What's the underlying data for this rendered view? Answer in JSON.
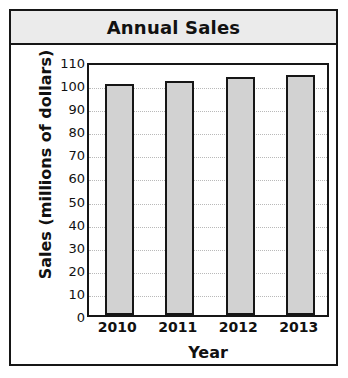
{
  "chart_data": {
    "type": "bar",
    "title": "Annual Sales",
    "xlabel": "Year",
    "ylabel": "Sales (millions of dollars)",
    "categories": [
      "2010",
      "2011",
      "2012",
      "2013"
    ],
    "values": [
      100,
      101.5,
      103,
      104
    ],
    "series": [
      {
        "name": "Annual Sales",
        "values": [
          100,
          101.5,
          103,
          104
        ]
      }
    ],
    "ylim": [
      0,
      110
    ],
    "ytick_step": 10,
    "yticks": [
      "110",
      "100",
      "90",
      "80",
      "70",
      "60",
      "50",
      "40",
      "30",
      "20",
      "10",
      "0"
    ],
    "grid": true,
    "legend": false,
    "bar_fill_color": "#d2d2d2",
    "bar_edge_color": "#161616",
    "gridline_color": "#b9b9b9",
    "title_band_color": "#ebebeb",
    "frame_color": "#161616"
  }
}
